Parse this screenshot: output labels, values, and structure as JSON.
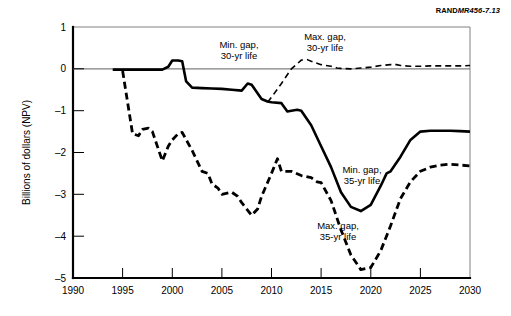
{
  "credit": {
    "brand": "RAND",
    "reference": "MR456-7.13"
  },
  "chart_data": {
    "type": "line",
    "title": "",
    "subtitle": "",
    "xlabel": "",
    "ylabel": "Billions of dollars (NPV)",
    "xlim": [
      1990,
      2030
    ],
    "ylim": [
      -5,
      1
    ],
    "xticks": [
      1990,
      1995,
      2000,
      2005,
      2010,
      2015,
      2020,
      2025,
      2030
    ],
    "xtick_labels": [
      "1990",
      "1995",
      "2000",
      "2005",
      "2010",
      "2015",
      "2020",
      "2025",
      "2030"
    ],
    "yticks": [
      1,
      0,
      -1,
      -2,
      -3,
      -4,
      -5
    ],
    "ytick_labels": [
      "1",
      "0",
      "–1",
      "–2",
      "–3",
      "–4",
      "–5"
    ],
    "grid": false,
    "legend": "inline-annotations",
    "zero_reference_line": true,
    "annotations": [
      {
        "name": "min-gap-30yr",
        "text_line1": "Min. gap,",
        "text_line2": "30-yr life",
        "x": 2006.0,
        "y": 0.62
      },
      {
        "name": "max-gap-30yr",
        "text_line1": "Max. gap,",
        "text_line2": "30-yr life",
        "x": 2012.6,
        "y": 0.8
      },
      {
        "name": "min-gap-35yr",
        "text_line1": "Min. gap,",
        "text_line2": "35-yr life",
        "x": 2019.0,
        "y": -2.45
      },
      {
        "name": "max-gap-35yr",
        "text_line1": "Max. gap,",
        "text_line2": "35-yr life",
        "x": 2016.6,
        "y": -3.8
      }
    ],
    "series": [
      {
        "name": "Min. gap, 30-yr life / 35-yr life",
        "style": "solid",
        "x": [
          1994.0,
          1995.0,
          1996.0,
          1997.0,
          1998.0,
          1999.0,
          1999.6,
          2000.0,
          2000.6,
          2001.0,
          2001.4,
          2002.0,
          2003.0,
          2004.0,
          2005.0,
          2006.0,
          2007.0,
          2007.6,
          2008.0,
          2009.0,
          2009.6,
          2010.0,
          2011.0,
          2011.6,
          2012.0,
          2012.6,
          2013.0,
          2014.0,
          2015.0,
          2016.0,
          2017.0,
          2018.0,
          2019.0,
          2020.0,
          2021.0,
          2021.6,
          2022.0,
          2023.0,
          2024.0,
          2025.0,
          2026.0,
          2027.0,
          2028.0,
          2029.0,
          2030.0
        ],
        "y": [
          -0.02,
          -0.02,
          -0.02,
          -0.02,
          -0.02,
          -0.02,
          0.05,
          0.2,
          0.2,
          0.18,
          -0.3,
          -0.45,
          -0.46,
          -0.47,
          -0.48,
          -0.5,
          -0.52,
          -0.35,
          -0.38,
          -0.72,
          -0.78,
          -0.8,
          -0.82,
          -1.02,
          -1.0,
          -0.98,
          -1.0,
          -1.35,
          -1.85,
          -2.35,
          -2.95,
          -3.3,
          -3.4,
          -3.25,
          -2.8,
          -2.5,
          -2.45,
          -2.1,
          -1.7,
          -1.5,
          -1.48,
          -1.48,
          -1.48,
          -1.49,
          -1.5
        ]
      },
      {
        "name": "Max. gap, 30-yr life",
        "style": "dashed-thin",
        "x": [
          2009.6,
          2010.0,
          2011.0,
          2012.0,
          2012.6,
          2013.0,
          2013.6,
          2014.0,
          2015.0,
          2016.0,
          2016.6,
          2017.0,
          2018.0,
          2019.0,
          2020.0,
          2021.0,
          2022.0,
          2022.6,
          2023.0,
          2024.0,
          2025.0,
          2026.0,
          2027.0,
          2028.0,
          2029.0,
          2030.0
        ],
        "y": [
          -0.8,
          -0.68,
          -0.35,
          0.0,
          0.12,
          0.21,
          0.22,
          0.18,
          0.1,
          0.06,
          0.02,
          0.01,
          0.0,
          0.02,
          0.04,
          0.08,
          0.1,
          0.1,
          0.08,
          0.06,
          0.06,
          0.07,
          0.07,
          0.07,
          0.07,
          0.08
        ]
      },
      {
        "name": "Max. gap, 35-yr life",
        "style": "dashed",
        "x": [
          1995.0,
          1996.0,
          1996.6,
          1997.0,
          1997.6,
          1998.0,
          1999.0,
          1999.6,
          2000.0,
          2000.6,
          2001.0,
          2002.0,
          2003.0,
          2003.6,
          2004.0,
          2004.6,
          2005.0,
          2006.0,
          2006.6,
          2007.0,
          2008.0,
          2008.6,
          2009.0,
          2010.0,
          2010.6,
          2011.0,
          2012.0,
          2013.0,
          2014.0,
          2014.6,
          2015.0,
          2016.0,
          2017.0,
          2018.0,
          2019.0,
          2020.0,
          2021.0,
          2022.0,
          2023.0,
          2024.0,
          2025.0,
          2026.0,
          2027.0,
          2028.0,
          2029.0,
          2030.0
        ],
        "y": [
          -0.05,
          -1.55,
          -1.6,
          -1.45,
          -1.42,
          -1.5,
          -2.2,
          -1.85,
          -1.7,
          -1.55,
          -1.52,
          -1.95,
          -2.45,
          -2.5,
          -2.75,
          -2.85,
          -3.0,
          -2.95,
          -3.05,
          -3.2,
          -3.5,
          -3.35,
          -3.05,
          -2.5,
          -2.15,
          -2.45,
          -2.45,
          -2.55,
          -2.6,
          -2.7,
          -2.72,
          -3.15,
          -3.85,
          -4.45,
          -4.8,
          -4.75,
          -4.35,
          -3.75,
          -3.1,
          -2.7,
          -2.45,
          -2.35,
          -2.3,
          -2.28,
          -2.3,
          -2.32
        ]
      }
    ]
  }
}
